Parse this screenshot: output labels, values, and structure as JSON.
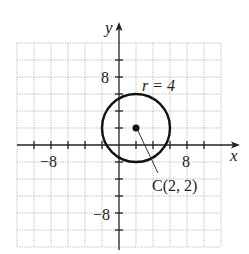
{
  "figure": {
    "x_axis_label": "x",
    "y_axis_label": "y",
    "x_tick_labels": [
      {
        "value": -8,
        "text": "−8"
      },
      {
        "value": 8,
        "text": "8"
      }
    ],
    "y_tick_labels": [
      {
        "value": 8,
        "text": "8"
      },
      {
        "value": -8,
        "text": "−8"
      }
    ],
    "radius_label": "r = 4",
    "center_label": "C(2, 2)",
    "circle": {
      "center_x": 2,
      "center_y": 2,
      "radius": 4
    },
    "grid": {
      "min": -12,
      "max": 12,
      "step": 2
    },
    "colors": {
      "curve": "#111111",
      "grid": "#9a9a9a",
      "axis": "#222222"
    }
  }
}
